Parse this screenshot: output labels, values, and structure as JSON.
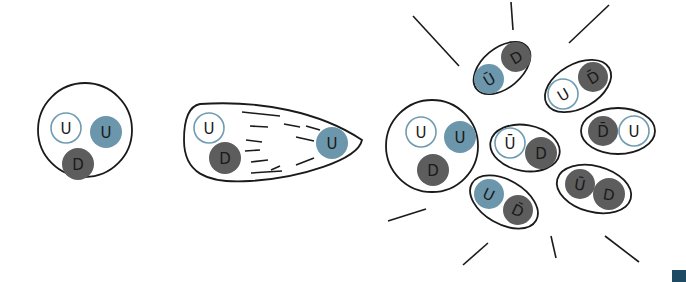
{
  "diagram": {
    "colors": {
      "outline": "#1a1a1a",
      "up_fill_light": "#ffffff",
      "up_stroke_light": "#6f9cb0",
      "up_blue": "#6b96ab",
      "down_dark": "#5d5d5d",
      "corner_square": "#1f4a63"
    },
    "quark_legend": {
      "U": "up quark",
      "D": "down quark",
      "Ū": "anti-up quark",
      "D̄": "anti-down quark"
    },
    "stages": [
      {
        "name": "proton",
        "shape": "circle",
        "cx": 85,
        "cy": 130,
        "r": 47,
        "quarks": [
          {
            "label": "U",
            "style": "outline",
            "cx": 66,
            "cy": 128,
            "r": 15
          },
          {
            "label": "U",
            "style": "blue",
            "cx": 106,
            "cy": 132,
            "r": 16
          },
          {
            "label": "D",
            "style": "dark",
            "cx": 78,
            "cy": 164,
            "r": 16
          }
        ]
      },
      {
        "name": "stretched-proton",
        "shape": "teardrop",
        "path": "M 200 104 C 260 100, 320 112, 362 140 C 358 160, 300 178, 250 181 C 205 184, 184 172, 184 140 C 184 116, 190 106, 200 104 Z",
        "quarks": [
          {
            "label": "U",
            "style": "outline",
            "cx": 209,
            "cy": 128,
            "r": 15
          },
          {
            "label": "D",
            "style": "dark",
            "cx": 225,
            "cy": 158,
            "r": 16
          },
          {
            "label": "U",
            "style": "blue",
            "cx": 332,
            "cy": 143,
            "r": 16
          }
        ],
        "streaks": [
          [
            242,
            112,
            280,
            116
          ],
          [
            250,
            126,
            268,
            127
          ],
          [
            284,
            124,
            300,
            127
          ],
          [
            306,
            126,
            320,
            130
          ],
          [
            246,
            140,
            262,
            142
          ],
          [
            296,
            137,
            314,
            141
          ],
          [
            245,
            151,
            260,
            150
          ],
          [
            251,
            162,
            268,
            160
          ],
          [
            271,
            170,
            280,
            166
          ],
          [
            296,
            165,
            314,
            158
          ],
          [
            251,
            173,
            282,
            171
          ]
        ]
      },
      {
        "name": "proton-after-collision",
        "shape": "circle",
        "cx": 432,
        "cy": 146,
        "r": 46,
        "quarks": [
          {
            "label": "U",
            "style": "outline",
            "cx": 421,
            "cy": 132,
            "r": 15
          },
          {
            "label": "U",
            "style": "blue",
            "cx": 460,
            "cy": 137,
            "r": 16
          },
          {
            "label": "D",
            "style": "dark",
            "cx": 433,
            "cy": 170,
            "r": 16
          }
        ]
      }
    ],
    "mesons": [
      {
        "name": "meson-anti-u-d-top",
        "cx": 502,
        "cy": 68,
        "rx": 33,
        "ry": 20,
        "rot": -40,
        "quarks": [
          {
            "label": "Ū",
            "style": "blue",
            "cx": 489,
            "cy": 79,
            "r": 15,
            "rot": -30
          },
          {
            "label": "D",
            "style": "dark",
            "cx": 516,
            "cy": 57,
            "r": 15,
            "rot": -30
          }
        ]
      },
      {
        "name": "meson-u-anti-d-upper-right",
        "cx": 578,
        "cy": 86,
        "rx": 36,
        "ry": 22,
        "rot": -30,
        "quarks": [
          {
            "label": "U",
            "style": "outline",
            "cx": 563,
            "cy": 94,
            "r": 15,
            "rot": -30
          },
          {
            "label": "D̄",
            "style": "dark",
            "cx": 593,
            "cy": 77,
            "r": 15,
            "rot": -30
          }
        ]
      },
      {
        "name": "meson-anti-d-u-right",
        "cx": 618,
        "cy": 131,
        "rx": 37,
        "ry": 23,
        "rot": 0,
        "quarks": [
          {
            "label": "D̄",
            "style": "dark",
            "cx": 603,
            "cy": 131,
            "r": 15,
            "rot": 0
          },
          {
            "label": "U",
            "style": "outline",
            "cx": 634,
            "cy": 131,
            "r": 15,
            "rot": 0
          }
        ]
      },
      {
        "name": "meson-anti-u-d-center",
        "cx": 525,
        "cy": 148,
        "rx": 35,
        "ry": 23,
        "rot": 10,
        "quarks": [
          {
            "label": "Ū",
            "style": "outline",
            "cx": 510,
            "cy": 143,
            "r": 15,
            "rot": 0
          },
          {
            "label": "D",
            "style": "dark",
            "cx": 541,
            "cy": 153,
            "r": 16,
            "rot": 0
          }
        ]
      },
      {
        "name": "meson-u-anti-d-bottom",
        "cx": 504,
        "cy": 202,
        "rx": 37,
        "ry": 22,
        "rot": 30,
        "quarks": [
          {
            "label": "U",
            "style": "blue",
            "cx": 489,
            "cy": 194,
            "r": 15,
            "rot": 25
          },
          {
            "label": "D̄",
            "style": "dark",
            "cx": 518,
            "cy": 210,
            "r": 15,
            "rot": 25
          }
        ]
      },
      {
        "name": "meson-anti-u-d-bottom-right",
        "cx": 594,
        "cy": 189,
        "rx": 38,
        "ry": 23,
        "rot": 15,
        "quarks": [
          {
            "label": "Ū",
            "style": "dark",
            "cx": 580,
            "cy": 184,
            "r": 15,
            "rot": 10
          },
          {
            "label": "D",
            "style": "dark",
            "cx": 609,
            "cy": 194,
            "r": 16,
            "rot": 10
          }
        ]
      }
    ],
    "burst_lines": [
      [
        413,
        16,
        459,
        66
      ],
      [
        511,
        2,
        513,
        30
      ],
      [
        609,
        5,
        569,
        43
      ],
      [
        388,
        221,
        426,
        209
      ],
      [
        463,
        265,
        488,
        243
      ],
      [
        551,
        236,
        556,
        258
      ],
      [
        605,
        236,
        639,
        262
      ]
    ]
  }
}
